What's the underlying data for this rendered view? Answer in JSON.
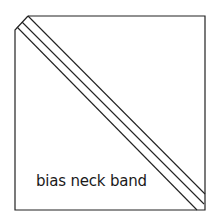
{
  "diagram": {
    "title": "bias neck band",
    "label": "bias neck band",
    "stroke_color": "#222222",
    "background": "#ffffff",
    "shape": "fabric square with cut top-left corner",
    "strips": 2,
    "lines": 3
  }
}
